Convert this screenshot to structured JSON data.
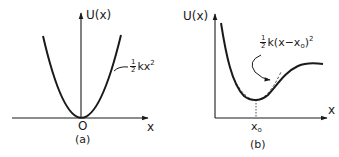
{
  "panels": [
    {
      "id": "a",
      "caption": "(a)",
      "y_axis_label": "U(x)",
      "x_axis_label": "x",
      "origin_label": "O",
      "curve_label": {
        "fraction_num": "1",
        "fraction_den": "2",
        "body": "kx",
        "exponent": "2"
      },
      "description": "Harmonic potential parabola U(x) = ½kx² with minimum at origin"
    },
    {
      "id": "b",
      "caption": "(b)",
      "y_axis_label": "U(x)",
      "x_axis_label": "x",
      "min_label": {
        "base": "x",
        "subscript": "o"
      },
      "curve_label": {
        "fraction_num": "1",
        "fraction_den": "2",
        "body_prefix": "k(x−x",
        "subscript": "o",
        "body_suffix": ")",
        "exponent": "2"
      },
      "description": "General potential well with minimum at x0, approximated by dashed parabola ½k(x−x0)²"
    }
  ],
  "colors": {
    "ink": "#1a1a1a",
    "background": "#ffffff"
  }
}
